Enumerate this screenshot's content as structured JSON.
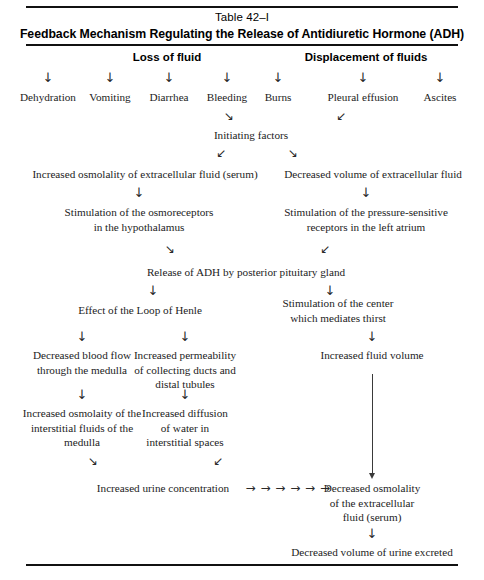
{
  "table": {
    "number_label": "Table 42–I",
    "title": "Feedback Mechanism Regulating the Release of Antidiuretic Hormone (ADH)"
  },
  "headers": {
    "left": "Loss of fluid",
    "right": "Displacement of fluids"
  },
  "causes": {
    "loss_of_fluid": [
      "Dehydration",
      "Vomiting",
      "Diarrhea",
      "Bleeding",
      "Burns"
    ],
    "displacement_of_fluids": [
      "Pleural effusion",
      "Ascites"
    ]
  },
  "flow": {
    "initiating_factors": "Initiating factors",
    "increased_osmolality_ecf": "Increased osmolality of extracellular fluid (serum)",
    "decreased_volume_ecf": "Decreased volume of extracellular fluid",
    "osmoreceptors_line1": "Stimulation of the osmoreceptors",
    "osmoreceptors_line2": "in the hypothalamus",
    "pressure_receptors_line1": "Stimulation of the pressure-sensitive",
    "pressure_receptors_line2": "receptors in the left atrium",
    "release_adh": "Release of ADH by posterior pituitary gland",
    "loop_of_henle": "Effect of the Loop of Henle",
    "thirst_center_line1": "Stimulation of the center",
    "thirst_center_line2": "which mediates thirst",
    "decreased_blood_flow_line1": "Decreased blood flow",
    "decreased_blood_flow_line2": "through the medulla",
    "increased_permeability_line1": "Increased permeability",
    "increased_permeability_line2": "of collecting ducts and",
    "increased_permeability_line3": "distal tubules",
    "increased_fluid_volume": "Increased fluid volume",
    "increased_osmolaity_line1": "Increased osmolaity of the",
    "increased_osmolaity_line2": "interstitial fluids of the",
    "increased_osmolaity_line3": "medulla",
    "increased_diffusion_line1": "Increased diffusion",
    "increased_diffusion_line2": "of water in",
    "increased_diffusion_line3": "interstitial spaces",
    "increased_urine_concentration": "Increased urine concentration",
    "decreased_osmolality_line1": "Decreased osmolality",
    "decreased_osmolality_line2": "of the extracellular",
    "decreased_osmolality_line3": "fluid (serum)",
    "decreased_urine_volume": "Decreased volume of urine excreted"
  },
  "arrows": {
    "down": "↓",
    "diag_down_right": "↘",
    "diag_down_left": "↙",
    "right_chain": "→ → → → → →"
  },
  "colors": {
    "rule": "#111111",
    "text": "#1c1c1c",
    "title": "#000000",
    "arrow": "#2a2a2a"
  }
}
